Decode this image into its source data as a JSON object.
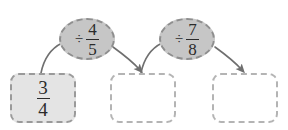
{
  "diagram": {
    "type": "flow-chain",
    "title": "",
    "palette": {
      "node_fill": "#e4e4e4",
      "ellipse_fill": "#c6c6c6",
      "empty_fill": "#ffffff",
      "border": "#a8a8a8",
      "connector": "#6f6f6f",
      "text": "#2b2b2b"
    },
    "nodes": [
      {
        "id": "start-value",
        "shape": "rounded-rect",
        "state": "filled",
        "has_value": true,
        "operator": "",
        "numerator": "3",
        "denominator": "4",
        "value_text": "3/4"
      },
      {
        "id": "operation-1",
        "shape": "ellipse",
        "state": "filled",
        "has_value": true,
        "operator": "÷",
        "numerator": "4",
        "denominator": "5",
        "value_text": "÷ 4/5"
      },
      {
        "id": "result-1",
        "shape": "rounded-rect",
        "state": "empty",
        "has_value": false,
        "operator": "",
        "numerator": "",
        "denominator": "",
        "value_text": ""
      },
      {
        "id": "operation-2",
        "shape": "ellipse",
        "state": "filled",
        "has_value": true,
        "operator": "÷",
        "numerator": "7",
        "denominator": "8",
        "value_text": "÷ 7/8"
      },
      {
        "id": "result-2",
        "shape": "rounded-rect",
        "state": "empty",
        "has_value": false,
        "operator": "",
        "numerator": "",
        "denominator": "",
        "value_text": ""
      }
    ],
    "connectors": [
      {
        "id": "c1",
        "from": "start-value",
        "to": "operation-1",
        "arrowhead": false
      },
      {
        "id": "c2",
        "from": "operation-1",
        "to": "result-1",
        "arrowhead": true
      },
      {
        "id": "c3",
        "from": "result-1",
        "to": "operation-2",
        "arrowhead": false
      },
      {
        "id": "c4",
        "from": "operation-2",
        "to": "result-2",
        "arrowhead": true
      }
    ]
  }
}
